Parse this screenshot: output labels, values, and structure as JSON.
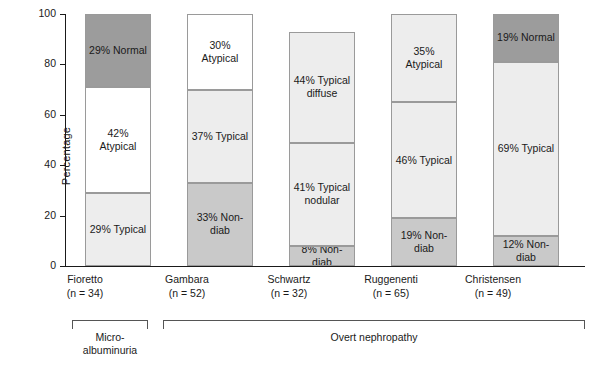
{
  "chart_data": {
    "type": "bar",
    "stacked": true,
    "title": "",
    "xlabel": "",
    "ylabel": "Percentage",
    "ylim": [
      0,
      100
    ],
    "yticks": [
      0,
      20,
      40,
      60,
      80,
      100
    ],
    "grid": false,
    "categories": [
      "Fioretto",
      "Gambara",
      "Schwartz",
      "Ruggenenti",
      "Christensen"
    ],
    "category_sublabels": [
      "(n = 34)",
      "(n = 52)",
      "(n = 32)",
      "(n = 65)",
      "(n = 49)"
    ],
    "bars": [
      {
        "category": "Fioretto",
        "sublabel": "(n = 34)",
        "segments": [
          {
            "label": "29% Typical",
            "value": 29,
            "color": "#ededed"
          },
          {
            "label": "42% Atypical",
            "value": 42,
            "color": "#ffffff"
          },
          {
            "label": "29% Normal",
            "value": 29,
            "color": "#9c9c9c"
          }
        ]
      },
      {
        "category": "Gambara",
        "sublabel": "(n = 52)",
        "segments": [
          {
            "label": "33% Non-diab",
            "value": 33,
            "color": "#c9c9c9"
          },
          {
            "label": "37% Typical",
            "value": 37,
            "color": "#ededed"
          },
          {
            "label": "30% Atypical",
            "value": 30,
            "color": "#ffffff"
          }
        ]
      },
      {
        "category": "Schwartz",
        "sublabel": "(n = 32)",
        "segments": [
          {
            "label": "8% Non-diab",
            "value": 8,
            "color": "#c9c9c9"
          },
          {
            "label": "41% Typical\nnodular",
            "value": 41,
            "color": "#ededed"
          },
          {
            "label": "44% Typical\ndiffuse",
            "value": 44,
            "color": "#ededed"
          }
        ]
      },
      {
        "category": "Ruggenenti",
        "sublabel": "(n = 65)",
        "segments": [
          {
            "label": "19% Non-diab",
            "value": 19,
            "color": "#c9c9c9"
          },
          {
            "label": "46% Typical",
            "value": 46,
            "color": "#ededed"
          },
          {
            "label": "35% Atypical",
            "value": 35,
            "color": "#ededed"
          }
        ]
      },
      {
        "category": "Christensen",
        "sublabel": "(n = 49)",
        "segments": [
          {
            "label": "12% Non-diab",
            "value": 12,
            "color": "#c9c9c9"
          },
          {
            "label": "69% Typical",
            "value": 69,
            "color": "#ededed"
          },
          {
            "label": "19% Normal",
            "value": 19,
            "color": "#9c9c9c"
          }
        ]
      }
    ],
    "group_brackets": [
      {
        "label": "Micro-\nalbuminuria",
        "spans": [
          "Fioretto"
        ]
      },
      {
        "label": "Overt nephropathy",
        "spans": [
          "Gambara",
          "Schwartz",
          "Ruggenenti",
          "Christensen"
        ]
      }
    ]
  }
}
